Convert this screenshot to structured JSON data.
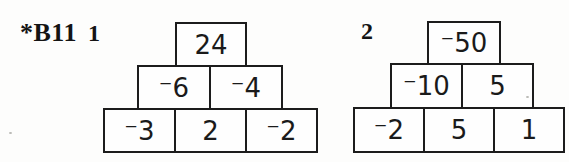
{
  "colors": {
    "ink": "#1c1c1c",
    "background": "#fdfdfc"
  },
  "exercise": {
    "label": "*B11",
    "problems": [
      {
        "number": "1",
        "pyramid": {
          "top": [
            "24"
          ],
          "middle": [
            "⁻6",
            "⁻4"
          ],
          "bottom": [
            "⁻3",
            "2",
            "⁻2"
          ]
        }
      },
      {
        "number": "2",
        "pyramid": {
          "top": [
            "⁻50"
          ],
          "middle": [
            "⁻10",
            "5"
          ],
          "bottom": [
            "⁻2",
            "5",
            "1"
          ]
        }
      }
    ]
  }
}
